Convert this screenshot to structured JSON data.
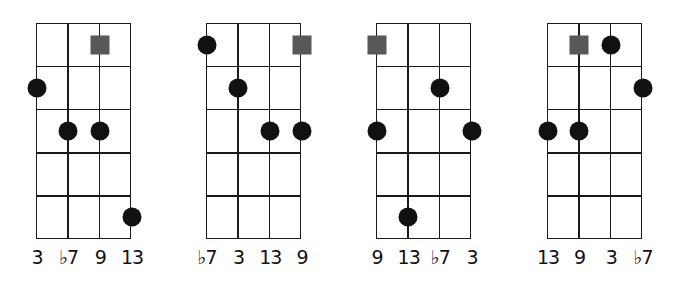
{
  "layout": {
    "strings": 4,
    "frets_shown": 5,
    "grid_top": 23,
    "grid_width": 95,
    "grid_height": 216
  },
  "legend": {
    "square": "root / reference note (gray square)",
    "dot": "fretted note (black dot)"
  },
  "colors": {
    "dot": "#111111",
    "root_square": "#585858",
    "grid": "#1a1a1a",
    "background": "#ffffff"
  },
  "diagrams": [
    {
      "grid_left": 36,
      "labels": [
        "3",
        "b7",
        "9",
        "13"
      ],
      "display_labels": [
        "3",
        "♭7",
        "9",
        "13"
      ],
      "markers": [
        {
          "type": "root",
          "string": 3,
          "fret": 1
        },
        {
          "type": "dot",
          "string": 1,
          "fret": 2
        },
        {
          "type": "dot",
          "string": 2,
          "fret": 3
        },
        {
          "type": "dot",
          "string": 3,
          "fret": 3
        },
        {
          "type": "dot",
          "string": 4,
          "fret": 5
        }
      ]
    },
    {
      "grid_left": 206,
      "labels": [
        "b7",
        "3",
        "13",
        "9"
      ],
      "display_labels": [
        "♭7",
        "3",
        "13",
        "9"
      ],
      "markers": [
        {
          "type": "dot",
          "string": 1,
          "fret": 1
        },
        {
          "type": "root",
          "string": 4,
          "fret": 1
        },
        {
          "type": "dot",
          "string": 2,
          "fret": 2
        },
        {
          "type": "dot",
          "string": 3,
          "fret": 3
        },
        {
          "type": "dot",
          "string": 4,
          "fret": 3
        }
      ]
    },
    {
      "grid_left": 376,
      "labels": [
        "9",
        "13",
        "b7",
        "3"
      ],
      "display_labels": [
        "9",
        "13",
        "♭7",
        "3"
      ],
      "markers": [
        {
          "type": "root",
          "string": 1,
          "fret": 1
        },
        {
          "type": "dot",
          "string": 3,
          "fret": 2
        },
        {
          "type": "dot",
          "string": 1,
          "fret": 3
        },
        {
          "type": "dot",
          "string": 4,
          "fret": 3
        },
        {
          "type": "dot",
          "string": 2,
          "fret": 5
        }
      ]
    },
    {
      "grid_left": 547,
      "labels": [
        "13",
        "9",
        "3",
        "b7"
      ],
      "display_labels": [
        "13",
        "9",
        "3",
        "♭7"
      ],
      "markers": [
        {
          "type": "root",
          "string": 2,
          "fret": 1
        },
        {
          "type": "dot",
          "string": 3,
          "fret": 1
        },
        {
          "type": "dot",
          "string": 4,
          "fret": 2
        },
        {
          "type": "dot",
          "string": 1,
          "fret": 3
        },
        {
          "type": "dot",
          "string": 2,
          "fret": 3
        }
      ]
    }
  ]
}
